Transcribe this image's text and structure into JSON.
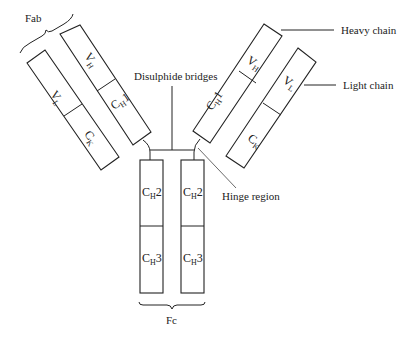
{
  "labels": {
    "fab": "Fab",
    "heavy_chain": "Heavy chain",
    "light_chain": "Light chain",
    "disulphide": "Disulphide bridges",
    "hinge": "Hinge region",
    "fc": "Fc"
  },
  "domains": {
    "left_vl": {
      "main": "V",
      "sub": "L"
    },
    "left_ck": {
      "main": "C",
      "sub": "K"
    },
    "left_vh": {
      "main": "V",
      "sub": "H"
    },
    "left_ch1": {
      "main": "C",
      "sub": "H",
      "suffix": "1"
    },
    "right_vh": {
      "main": "V",
      "sub": "H"
    },
    "right_ch1": {
      "main": "C",
      "sub": "H",
      "suffix": "1"
    },
    "right_vl": {
      "main": "V",
      "sub": "L"
    },
    "right_ck": {
      "main": "C",
      "sub": "K"
    },
    "fc_left_ch2": {
      "main": "C",
      "sub": "H",
      "suffix": "2"
    },
    "fc_left_ch3": {
      "main": "C",
      "sub": "H",
      "suffix": "3"
    },
    "fc_right_ch2": {
      "main": "C",
      "sub": "H",
      "suffix": "2"
    },
    "fc_right_ch3": {
      "main": "C",
      "sub": "H",
      "suffix": "3"
    }
  }
}
